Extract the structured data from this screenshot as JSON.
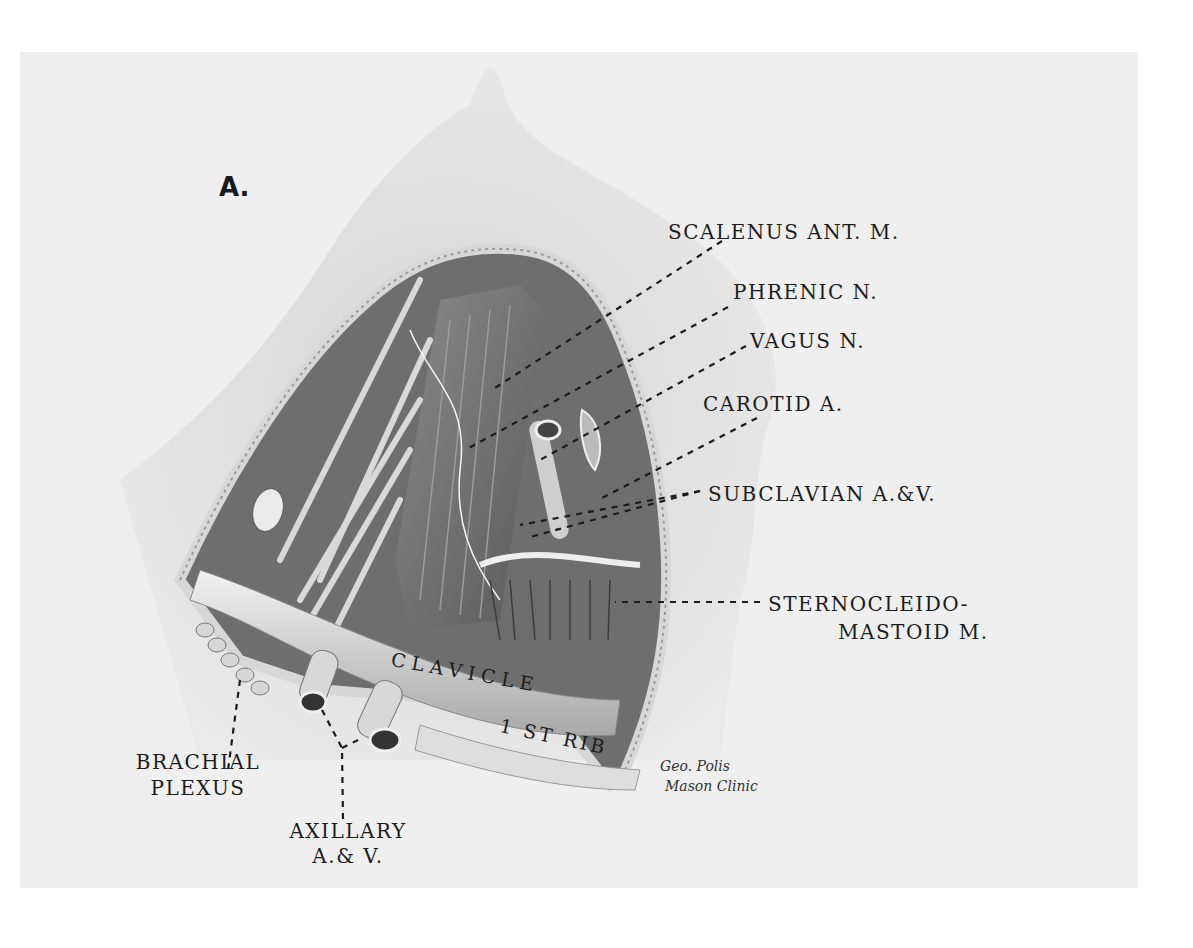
{
  "figure": {
    "panel_letter": "A.",
    "colors": {
      "plate": "#efefef",
      "ink": "#1c1c1c",
      "silhouette": "#d8d8d8",
      "dissection_dark": "#555555"
    }
  },
  "labels": {
    "scalenus": "SCALENUS ANT. M.",
    "phrenic": "PHRENIC N.",
    "vagus": "VAGUS N.",
    "carotid": "CAROTID A.",
    "subclavian": "SUBCLAVIAN A.&V.",
    "sterno_line1": "STERNOCLEIDO-",
    "sterno_line2": "MASTOID M.",
    "clavicle": "CLAVICLE",
    "first_rib": "1 ST RIB",
    "brachial_line1": "BRACHIAL",
    "brachial_line2": "PLEXUS",
    "axillary_line1": "AXILLARY",
    "axillary_line2": "A.& V."
  },
  "signature": {
    "line1": "Geo. Polis",
    "line2": "Mason Clinic"
  }
}
